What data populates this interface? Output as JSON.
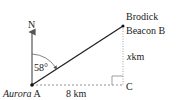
{
  "diagram": {
    "north_label": "N",
    "angle_label": "58°",
    "point_a": {
      "name": "Aurora",
      "letter": "A"
    },
    "point_b": {
      "line1": "Brodick",
      "line2": "Beacon B"
    },
    "point_c": {
      "letter": "C"
    },
    "side_ac": "8 km",
    "side_bc_var": "x",
    "side_bc_unit": "km",
    "colors": {
      "line": "#222222",
      "dashed": "#777777"
    }
  }
}
